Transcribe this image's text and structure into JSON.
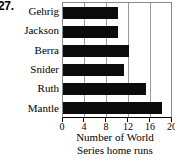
{
  "problem_number": "27.",
  "chart_data": {
    "type": "bar",
    "orientation": "horizontal",
    "title": "",
    "xlabel_lines": [
      "Number of World",
      "Series home runs"
    ],
    "xlabel": "Number of World Series home runs",
    "ylabel": "",
    "categories": [
      "Gehrig",
      "Jackson",
      "Berra",
      "Snider",
      "Ruth",
      "Mantle"
    ],
    "values": [
      10,
      10,
      12,
      11,
      15,
      18
    ],
    "xlim": [
      0,
      20
    ],
    "xticks": [
      0,
      4,
      8,
      12,
      16,
      20
    ],
    "xtick_labels": [
      "0",
      "4",
      "8",
      "12",
      "16",
      "20"
    ],
    "grid": true,
    "grid_axis": "x",
    "legend": false,
    "bar_color": "#0b0b0b",
    "grid_color": "#9a9a9a",
    "frame_color": "#8a8a8a",
    "background_color": "#ffffff"
  }
}
